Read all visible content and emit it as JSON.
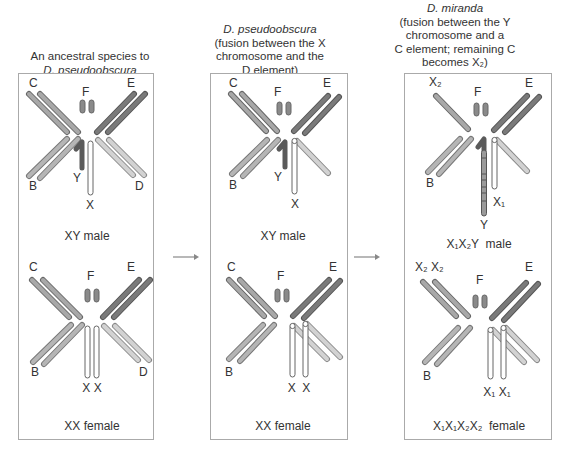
{
  "columns": [
    {
      "caption_italic": "",
      "caption_lines": [
        "An ancestral species to"
      ],
      "caption_italic_bottom": "D. pseudoobscura",
      "male_label": "XY male",
      "female_label": "XX female",
      "male_chromosomes": {
        "C": "C",
        "E": "E",
        "F": "F",
        "B": "B",
        "D": "D",
        "Y": "Y",
        "X": "X"
      },
      "female_chromosomes": {
        "C": "C",
        "E": "E",
        "F": "F",
        "B": "B",
        "D": "D",
        "X_pair": "X X"
      }
    },
    {
      "caption_italic": "D. pseudoobscura",
      "caption_lines": [
        "(fusion between the X",
        "chromosome and the",
        "D element)"
      ],
      "male_label": "XY  male",
      "female_label": "XX female",
      "male_chromosomes": {
        "C": "C",
        "E": "E",
        "F": "F",
        "B": "B",
        "Y": "Y",
        "X": "X"
      },
      "female_chromosomes": {
        "C": "C",
        "E": "E",
        "F": "F",
        "B": "B",
        "X_pair": "X  X"
      }
    },
    {
      "caption_italic": "D. miranda",
      "caption_lines": [
        "(fusion between the Y",
        "chromosome and a",
        "C element; remaining C",
        "becomes X₂)"
      ],
      "male_label": "X₁X₂Y  male",
      "female_label": "X₁X₁X₂X₂  female",
      "male_chromosomes": {
        "X2": "X₂",
        "E": "E",
        "F": "F",
        "B": "B",
        "X1": "X₁",
        "Y": "Y"
      },
      "female_chromosomes": {
        "X2_pair": "X₂ X₂",
        "E": "E",
        "F": "F",
        "B": "B",
        "X1_pair": "X₁ X₁"
      }
    }
  ],
  "colors": {
    "C_B_fill": "#a8a8a8",
    "E_fill": "#7a7a7a",
    "D_fill": "#cfcfcf",
    "F_fill": "#8a8a8a",
    "Y_fill": "#6e6e6e",
    "X_fill": "#ffffff",
    "outline": "#666666",
    "panel_border": "#aaaaaa",
    "arrow": "#888888"
  }
}
